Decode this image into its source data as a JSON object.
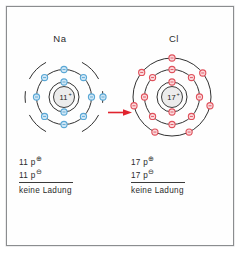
{
  "figure": {
    "background_color": "#fefefe",
    "frame_color": "#8b8d8f"
  },
  "arrow": {
    "name": "electron-transfer-arrow",
    "direction": "right",
    "color": "#e0232e"
  },
  "atoms": [
    {
      "id": "sodium",
      "symbol": "Na",
      "nucleus_label": "11",
      "nucleus_charge_sign": "+",
      "electron_color": "#5aa8d6",
      "electron_fill": "#cfe6f5",
      "shell_color": "#1a1a1a",
      "shell_style": "dashed",
      "shell_counts": [
        2,
        8,
        1
      ],
      "legend": {
        "protons_line": "11 p",
        "protons_sup": "⊕",
        "electrons_line": "11 p",
        "electrons_sup": "⊖",
        "total": "keine Ladung"
      }
    },
    {
      "id": "chlorine",
      "symbol": "Cl",
      "nucleus_label": "17",
      "nucleus_charge_sign": "+",
      "electron_color": "#e0515c",
      "electron_fill": "#fad9dc",
      "shell_color": "#1a1a1a",
      "shell_style": "solid",
      "shell_counts": [
        2,
        8,
        7
      ],
      "legend": {
        "protons_line": "17 p",
        "protons_sup": "⊕",
        "electrons_line": "17 p",
        "electrons_sup": "⊖",
        "total": "keine Ladung"
      }
    }
  ],
  "chart_data": {
    "type": "diagram",
    "subtype": "bohr-shell-model",
    "items": [
      {
        "element": "Na",
        "protons": 11,
        "electrons": 11,
        "shells": [
          2,
          8,
          1
        ],
        "net_charge_text": "keine Ladung",
        "color": "#5aa8d6"
      },
      {
        "element": "Cl",
        "protons": 17,
        "electrons": 17,
        "shells": [
          2,
          8,
          7
        ],
        "net_charge_text": "keine Ladung",
        "color": "#e0515c"
      }
    ],
    "annotations": [
      "red arrow from Na to Cl indicating electron transfer direction"
    ]
  }
}
